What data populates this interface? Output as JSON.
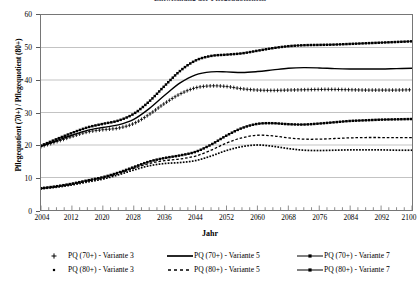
{
  "chart_title": "Entwicklung der Pflegequotienten",
  "axes": {
    "ylabel": "Pflegequotient (70+) / Pflegequotient (80+)",
    "xlabel": "Jahr",
    "yticks": [
      0,
      10,
      20,
      30,
      40,
      50,
      60
    ],
    "xticks": [
      2004,
      2012,
      2020,
      2028,
      2036,
      2044,
      2052,
      2060,
      2068,
      2076,
      2084,
      2092,
      2100
    ]
  },
  "legend": {
    "columns": [
      [
        {
          "label": "PQ (70+) - Variante 3",
          "symbol": "plus-marker"
        },
        {
          "label": "PQ (80+) - Variante 3",
          "symbol": "dot-marker"
        }
      ],
      [
        {
          "label": "PQ (70+) - Variante 5",
          "symbol": "solid-line"
        },
        {
          "label": "PQ (80+) - Variante 5",
          "symbol": "dashed-line"
        }
      ],
      [
        {
          "label": "PQ (70+) - Variante 7",
          "symbol": "line-with-square-marker"
        },
        {
          "label": "PQ (80+) - Variante 7",
          "symbol": "line-with-square-marker"
        }
      ]
    ]
  },
  "chart_data": {
    "type": "line",
    "title": "Entwicklung der Pflegequotienten",
    "xlabel": "Jahr",
    "ylabel": "Pflegequotient (70+) / Pflegequotient (80+)",
    "xlim": [
      2004,
      2100
    ],
    "ylim": [
      0,
      60
    ],
    "grid": "horizontal",
    "legend_position": "bottom",
    "x": [
      2004,
      2008,
      2012,
      2016,
      2020,
      2024,
      2028,
      2032,
      2036,
      2040,
      2044,
      2048,
      2052,
      2056,
      2060,
      2064,
      2068,
      2072,
      2076,
      2080,
      2084,
      2088,
      2092,
      2096,
      2100
    ],
    "series": [
      {
        "name": "PQ (70+) - Variante 3",
        "style": "plus-marker",
        "values": [
          19.5,
          21.0,
          22.6,
          24.0,
          24.7,
          25.2,
          26.6,
          29.4,
          32.8,
          35.7,
          37.6,
          38.2,
          38.0,
          37.3,
          36.9,
          36.8,
          36.9,
          37.0,
          37.1,
          37.1,
          37.0,
          36.9,
          36.9,
          36.9,
          37.0
        ]
      },
      {
        "name": "PQ (80+) - Variante 3",
        "style": "dot-marker",
        "values": [
          6.5,
          7.0,
          7.7,
          8.6,
          9.5,
          10.8,
          12.3,
          13.6,
          14.3,
          14.6,
          15.2,
          16.6,
          18.3,
          19.5,
          20.0,
          19.6,
          18.9,
          18.4,
          18.3,
          18.4,
          18.5,
          18.5,
          18.5,
          18.4,
          18.4
        ]
      },
      {
        "name": "PQ (70+) - Variante 5",
        "style": "solid-line",
        "values": [
          19.6,
          21.3,
          23.0,
          24.5,
          25.4,
          26.2,
          27.9,
          31.2,
          35.3,
          39.1,
          41.6,
          42.5,
          42.5,
          42.3,
          42.6,
          43.1,
          43.6,
          43.8,
          43.7,
          43.5,
          43.4,
          43.4,
          43.4,
          43.5,
          43.6
        ]
      },
      {
        "name": "PQ (80+) - Variante 5",
        "style": "dashed-line",
        "values": [
          6.6,
          7.2,
          7.9,
          8.9,
          9.8,
          11.2,
          12.8,
          14.3,
          15.2,
          15.7,
          16.6,
          18.4,
          20.6,
          22.2,
          23.0,
          22.8,
          22.2,
          21.8,
          21.8,
          22.0,
          22.2,
          22.3,
          22.3,
          22.3,
          22.3
        ]
      },
      {
        "name": "PQ (70+) - Variante 7",
        "style": "line-with-square-marker",
        "values": [
          19.8,
          21.8,
          23.7,
          25.4,
          26.5,
          27.5,
          29.6,
          33.4,
          38.2,
          42.8,
          46.0,
          47.4,
          47.8,
          48.2,
          49.0,
          49.8,
          50.4,
          50.7,
          50.8,
          50.9,
          51.1,
          51.3,
          51.5,
          51.7,
          51.9
        ]
      },
      {
        "name": "PQ (80+) - Variante 7",
        "style": "line-with-square-marker",
        "values": [
          6.7,
          7.3,
          8.1,
          9.1,
          10.1,
          11.5,
          13.2,
          14.9,
          16.0,
          16.8,
          17.9,
          20.1,
          22.9,
          25.2,
          26.5,
          26.7,
          26.4,
          26.3,
          26.6,
          27.0,
          27.4,
          27.6,
          27.8,
          27.9,
          28.0
        ]
      }
    ]
  }
}
